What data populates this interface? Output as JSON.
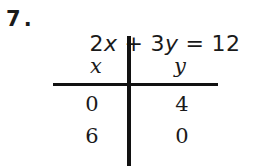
{
  "problem": {
    "number": "7",
    "number_separator": ".",
    "equation": {
      "full_text": "2x + 3y = 12",
      "left_coefficient_x": "2",
      "variable_x": "x",
      "operator": "+",
      "left_coefficient_y": "3",
      "variable_y": "y",
      "equals": "=",
      "constant": "12"
    }
  },
  "table": {
    "headers": {
      "x": "x",
      "y": "y"
    },
    "rows": [
      {
        "x": "0",
        "y": "4"
      },
      {
        "x": "6",
        "y": "0"
      }
    ]
  },
  "style": {
    "ink_color": "#111111",
    "page_color": "#ffffff"
  }
}
